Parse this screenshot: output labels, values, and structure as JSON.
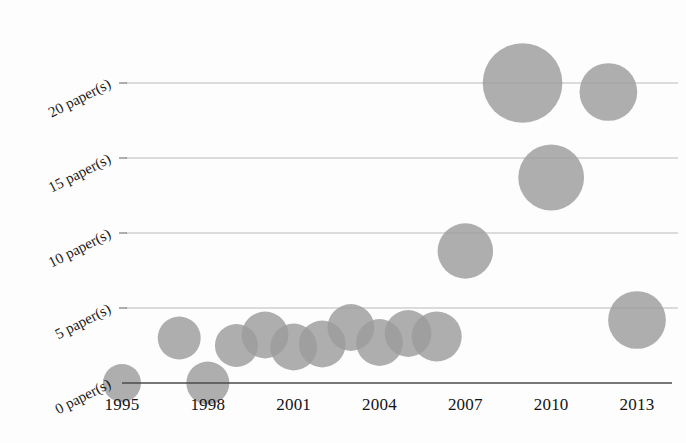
{
  "chart_data": {
    "type": "scatter",
    "title": "",
    "subtitle": "",
    "xlabel": "",
    "ylabel": "",
    "xlim": [
      1994.2,
      2014.0
    ],
    "ylim": [
      -1.6,
      21.8
    ],
    "grid": true,
    "legend": false,
    "legend_position": "none",
    "bubble_color": "#9c9c9c",
    "gridline_color": "#b9b9b9",
    "axis_color": "#4a4a4a",
    "x_ticks": [
      1995,
      1998,
      2001,
      2004,
      2007,
      2010,
      2013
    ],
    "x_tick_labels": [
      "1995",
      "1998",
      "2001",
      "2004",
      "2007",
      "2010",
      "2013"
    ],
    "y_ticks": [
      0,
      5,
      10,
      15,
      20
    ],
    "y_tick_labels": [
      "0 paper(s)",
      "5 paper(s)",
      "10 paper(s)",
      "15 paper(s)",
      "20 paper(s)"
    ],
    "y_label_rotation_deg": -27,
    "series": [
      {
        "name": "papers per year",
        "points": [
          {
            "x": 1995,
            "y": 0,
            "size": 1
          },
          {
            "x": 1997,
            "y": 3,
            "size": 2
          },
          {
            "x": 1998,
            "y": 0,
            "size": 2
          },
          {
            "x": 1999,
            "y": 2.5,
            "size": 2
          },
          {
            "x": 2000,
            "y": 3.2,
            "size": 3
          },
          {
            "x": 2001,
            "y": 2.4,
            "size": 3
          },
          {
            "x": 2002,
            "y": 2.6,
            "size": 3
          },
          {
            "x": 2003,
            "y": 3.7,
            "size": 3
          },
          {
            "x": 2004,
            "y": 2.7,
            "size": 3
          },
          {
            "x": 2005,
            "y": 3.3,
            "size": 3
          },
          {
            "x": 2006,
            "y": 3.1,
            "size": 4
          },
          {
            "x": 2007,
            "y": 8.8,
            "size": 6
          },
          {
            "x": 2009,
            "y": 20,
            "size": 20
          },
          {
            "x": 2010,
            "y": 13.7,
            "size": 11
          },
          {
            "x": 2012,
            "y": 19.4,
            "size": 7
          },
          {
            "x": 2013,
            "y": 4.2,
            "size": 7
          }
        ]
      }
    ]
  }
}
